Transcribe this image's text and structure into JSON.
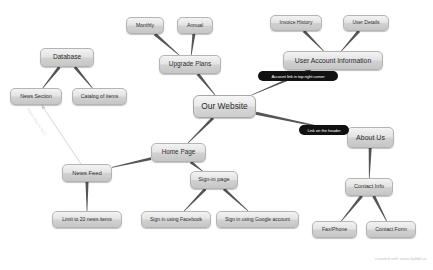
{
  "diagram": {
    "background_color": "#ffffff",
    "node_fill_color": "#dcdcdc",
    "node_border_color": "#b4b4b4",
    "callout_color": "#111111",
    "edge_color": "#555555",
    "watermark": "created with www.bubbl.us",
    "edge_label": "Link to the news"
  },
  "nodes": [
    {
      "id": "monthly",
      "label": "Monthly",
      "x": 126,
      "y": 17,
      "w": 38,
      "h": 17,
      "font": 5.2,
      "kind": "leaf"
    },
    {
      "id": "annual",
      "label": "Annual",
      "x": 177,
      "y": 17,
      "w": 36,
      "h": 17,
      "font": 5.2,
      "kind": "leaf"
    },
    {
      "id": "invoice",
      "label": "Invoice History",
      "x": 270,
      "y": 15,
      "w": 52,
      "h": 16,
      "font": 5.0,
      "kind": "leaf"
    },
    {
      "id": "userdetails",
      "label": "User Details",
      "x": 343,
      "y": 15,
      "w": 46,
      "h": 16,
      "font": 5.0,
      "kind": "leaf"
    },
    {
      "id": "database",
      "label": "Database",
      "x": 40,
      "y": 48,
      "w": 54,
      "h": 19,
      "font": 6.6,
      "kind": "branch"
    },
    {
      "id": "upgrade",
      "label": "Upgrade Plans",
      "x": 159,
      "y": 55,
      "w": 62,
      "h": 19,
      "font": 6.4,
      "kind": "branch"
    },
    {
      "id": "useraccount",
      "label": "User Account Information",
      "x": 283,
      "y": 51,
      "w": 100,
      "h": 19,
      "font": 6.8,
      "kind": "branch"
    },
    {
      "id": "newssection",
      "label": "News Section",
      "x": 10,
      "y": 88,
      "w": 52,
      "h": 17,
      "font": 5.2,
      "kind": "leaf"
    },
    {
      "id": "catalog",
      "label": "Catalog of items",
      "x": 72,
      "y": 88,
      "w": 55,
      "h": 17,
      "font": 5.2,
      "kind": "leaf"
    },
    {
      "id": "ourwebsite",
      "label": "Our Website",
      "x": 193,
      "y": 95,
      "w": 63,
      "h": 23,
      "font": 8.4,
      "kind": "central"
    },
    {
      "id": "aboutus",
      "label": "About Us",
      "x": 347,
      "y": 127,
      "w": 47,
      "h": 21,
      "font": 7.0,
      "kind": "branch"
    },
    {
      "id": "homepage",
      "label": "Home Page",
      "x": 151,
      "y": 143,
      "w": 55,
      "h": 19,
      "font": 6.4,
      "kind": "branch"
    },
    {
      "id": "newsfeed",
      "label": "News Feed",
      "x": 62,
      "y": 164,
      "w": 50,
      "h": 18,
      "font": 5.8,
      "kind": "branch"
    },
    {
      "id": "signinpage",
      "label": "Sign-in page",
      "x": 190,
      "y": 171,
      "w": 48,
      "h": 18,
      "font": 5.6,
      "kind": "branch"
    },
    {
      "id": "contactinfo",
      "label": "Contact Info",
      "x": 345,
      "y": 178,
      "w": 48,
      "h": 18,
      "font": 5.6,
      "kind": "branch"
    },
    {
      "id": "limit20",
      "label": "Limit to 20 news items",
      "x": 52,
      "y": 211,
      "w": 70,
      "h": 17,
      "font": 5.0,
      "kind": "leaf"
    },
    {
      "id": "facebook",
      "label": "Sign in using Facebook",
      "x": 141,
      "y": 211,
      "w": 70,
      "h": 17,
      "font": 5.0,
      "kind": "leaf"
    },
    {
      "id": "google",
      "label": "Sign in using Google account",
      "x": 216,
      "y": 211,
      "w": 83,
      "h": 17,
      "font": 5.0,
      "kind": "leaf"
    },
    {
      "id": "faxphone",
      "label": "Fax/Phone",
      "x": 312,
      "y": 221,
      "w": 45,
      "h": 17,
      "font": 5.2,
      "kind": "leaf"
    },
    {
      "id": "contactform",
      "label": "Contact Form",
      "x": 366,
      "y": 221,
      "w": 50,
      "h": 17,
      "font": 5.2,
      "kind": "leaf"
    }
  ],
  "callouts": [
    {
      "id": "account-link",
      "label": "Account link in top right corner",
      "x": 258,
      "y": 71,
      "w": 80,
      "h": 10,
      "font": 4.2
    },
    {
      "id": "header-link",
      "label": "Link on the header",
      "x": 299,
      "y": 125,
      "w": 50,
      "h": 10,
      "font": 4.2
    }
  ],
  "edges": [
    {
      "from": "monthly",
      "to": "upgrade"
    },
    {
      "from": "annual",
      "to": "upgrade"
    },
    {
      "from": "invoice",
      "to": "useraccount"
    },
    {
      "from": "userdetails",
      "to": "useraccount"
    },
    {
      "from": "database",
      "to": "newssection"
    },
    {
      "from": "database",
      "to": "catalog"
    },
    {
      "from": "upgrade",
      "to": "ourwebsite"
    },
    {
      "from": "useraccount",
      "to": "ourwebsite"
    },
    {
      "from": "ourwebsite",
      "to": "aboutus"
    },
    {
      "from": "ourwebsite",
      "to": "homepage"
    },
    {
      "from": "homepage",
      "to": "newsfeed"
    },
    {
      "from": "homepage",
      "to": "signinpage"
    },
    {
      "from": "newsfeed",
      "to": "limit20"
    },
    {
      "from": "signinpage",
      "to": "facebook"
    },
    {
      "from": "signinpage",
      "to": "google"
    },
    {
      "from": "aboutus",
      "to": "contactinfo"
    },
    {
      "from": "contactinfo",
      "to": "faxphone"
    },
    {
      "from": "contactinfo",
      "to": "contactform"
    },
    {
      "from": "newsfeed",
      "to": "newssection",
      "style": "faint-arrow"
    }
  ]
}
